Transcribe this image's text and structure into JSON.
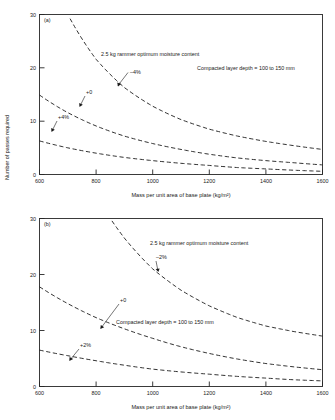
{
  "figure": {
    "y_axis_label": "Number of passes required",
    "x_axis_label": "Mass per unit area of base plate (kg/m²)"
  },
  "chart_data": [
    {
      "type": "line",
      "panel": "(a)",
      "title": "",
      "xlabel": "Mass per unit area of base plate (kg/m²)",
      "ylabel": "Number of passes required",
      "xlim": [
        600,
        1600
      ],
      "ylim": [
        0,
        30
      ],
      "xticks": [
        600,
        800,
        1000,
        1200,
        1400,
        1600
      ],
      "yticks": [
        0,
        10,
        20,
        30
      ],
      "grid": false,
      "legend": "none",
      "annotations": [
        "2.5 kg rammer optimum moisture content",
        "Compacted layer depth = 100 to 150 mm"
      ],
      "x": [
        600,
        700,
        800,
        900,
        1000,
        1100,
        1200,
        1300,
        1400,
        1500,
        1600
      ],
      "series": [
        {
          "name": "−4%",
          "label": "−4%",
          "values": [
            42.0,
            30.0,
            21.6,
            16.3,
            12.8,
            10.3,
            8.5,
            7.2,
            6.2,
            5.4,
            4.7
          ]
        },
        {
          "name": "+0",
          "label": "+0",
          "values": [
            14.9,
            11.6,
            9.1,
            7.2,
            5.8,
            4.7,
            3.8,
            3.1,
            2.6,
            2.2,
            1.8
          ]
        },
        {
          "name": "+4%",
          "label": "+4%",
          "values": [
            6.3,
            5.0,
            4.0,
            3.2,
            2.6,
            2.1,
            1.7,
            1.3,
            1.05,
            0.8,
            0.6
          ]
        }
      ]
    },
    {
      "type": "line",
      "panel": "(b)",
      "title": "",
      "xlabel": "Mass per unit area of base plate (kg/m²)",
      "ylabel": "Number of passes required",
      "xlim": [
        600,
        1600
      ],
      "ylim": [
        0,
        30
      ],
      "xticks": [
        600,
        800,
        1000,
        1200,
        1400,
        1600
      ],
      "yticks": [
        0,
        10,
        20,
        30
      ],
      "grid": false,
      "legend": "none",
      "annotations": [
        "2.5 kg rammer optimum moisture content",
        "Compacted layer depth = 100 to 150 mm"
      ],
      "x": [
        600,
        700,
        800,
        900,
        1000,
        1100,
        1200,
        1300,
        1400,
        1500,
        1600
      ],
      "series": [
        {
          "name": "−2%",
          "label": "−2%",
          "values": [
            60.0,
            45.0,
            34.0,
            26.5,
            21.0,
            17.2,
            14.4,
            12.3,
            10.8,
            9.8,
            9.0
          ]
        },
        {
          "name": "+0",
          "label": "+0",
          "values": [
            17.8,
            14.8,
            12.3,
            10.3,
            8.6,
            7.1,
            5.9,
            4.9,
            4.1,
            3.5,
            3.0
          ]
        },
        {
          "name": "+2%",
          "label": "+2%",
          "values": [
            6.5,
            5.5,
            4.6,
            3.8,
            3.1,
            2.6,
            2.2,
            1.8,
            1.5,
            1.2,
            1.0
          ]
        }
      ]
    }
  ],
  "panel_a": {
    "id": "(a)",
    "note_rammer": "2.5 kg rammer optimum moisture content",
    "note_depth": "Compacted layer depth = 100 to 150 mm",
    "lbl_minus": "–4%",
    "lbl_zero": "+0",
    "lbl_plus": "+4%",
    "xticks": [
      "600",
      "800",
      "1000",
      "1200",
      "1400",
      "1600"
    ],
    "yticks": [
      "0",
      "10",
      "20",
      "30"
    ],
    "xlabel": "Mass per unit area of base plate (kg/m²)"
  },
  "panel_b": {
    "id": "(b)",
    "note_rammer": "2.5 kg rammer optimum moisture content",
    "note_depth": "Compacted layer depth = 100 to 150 mm",
    "lbl_minus": "–2%",
    "lbl_zero": "+0",
    "lbl_plus": "+2%",
    "xticks": [
      "600",
      "800",
      "1000",
      "1200",
      "1400",
      "1600"
    ],
    "yticks": [
      "0",
      "10",
      "20",
      "30"
    ],
    "xlabel": "Mass per unit area of base plate (kg/m²)"
  }
}
